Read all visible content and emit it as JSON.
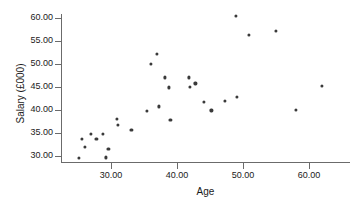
{
  "chart_data": {
    "type": "scatter",
    "title": "",
    "xlabel": "Age",
    "ylabel": "Salary (£000)",
    "xlim": [
      24.2,
      67.8
    ],
    "ylim": [
      28.3,
      61.4
    ],
    "xticks": [
      30,
      40,
      50,
      60
    ],
    "xtick_labels": [
      "30.00",
      "40.00",
      "50.00",
      "60.00"
    ],
    "yticks": [
      30,
      35,
      40,
      45,
      50,
      55,
      60
    ],
    "ytick_labels": [
      "30.00",
      "35.00",
      "40.00",
      "45.00",
      "50.00",
      "55.00",
      "60.00"
    ],
    "grid": false,
    "legend": null,
    "marker_color": "#3a3a3a",
    "axis_color": "#6b6b6b",
    "points": [
      {
        "x": 25.1,
        "y": 29.6
      },
      {
        "x": 25.6,
        "y": 33.7
      },
      {
        "x": 26.0,
        "y": 31.9
      },
      {
        "x": 26.9,
        "y": 34.8
      },
      {
        "x": 27.8,
        "y": 33.7
      },
      {
        "x": 28.8,
        "y": 34.8
      },
      {
        "x": 29.2,
        "y": 29.7
      },
      {
        "x": 29.6,
        "y": 31.6
      },
      {
        "x": 30.9,
        "y": 38.0
      },
      {
        "x": 31.0,
        "y": 36.7
      },
      {
        "x": 33.1,
        "y": 35.7
      },
      {
        "x": 35.4,
        "y": 39.8
      },
      {
        "x": 36.1,
        "y": 50.1
      },
      {
        "x": 36.9,
        "y": 52.2
      },
      {
        "x": 37.2,
        "y": 40.8
      },
      {
        "x": 38.2,
        "y": 47.1
      },
      {
        "x": 38.8,
        "y": 44.9
      },
      {
        "x": 39.0,
        "y": 37.9
      },
      {
        "x": 41.8,
        "y": 47.1
      },
      {
        "x": 41.9,
        "y": 45.0
      },
      {
        "x": 42.8,
        "y": 45.8
      },
      {
        "x": 44.1,
        "y": 41.8
      },
      {
        "x": 45.2,
        "y": 39.9
      },
      {
        "x": 47.3,
        "y": 41.9
      },
      {
        "x": 48.9,
        "y": 60.5
      },
      {
        "x": 49.1,
        "y": 42.9
      },
      {
        "x": 50.9,
        "y": 56.4
      },
      {
        "x": 55.0,
        "y": 57.2
      },
      {
        "x": 58.0,
        "y": 40.1
      },
      {
        "x": 62.0,
        "y": 45.2
      }
    ]
  }
}
